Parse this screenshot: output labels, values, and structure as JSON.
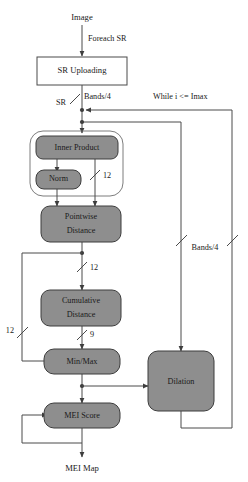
{
  "diagram": {
    "canvas": {
      "width": 248,
      "height": 482
    },
    "colors": {
      "background": "#ffffff",
      "process_fill": "#8e8e8e",
      "process_stroke": "#3d3d3d",
      "plain_fill": "#ffffff",
      "plain_stroke": "#4a4a4a",
      "group_stroke": "#6e6e6e",
      "edge": "#4a4a4a",
      "text": "#1a1a1a"
    },
    "terminals": {
      "input": "Image",
      "output": "MEI Map"
    },
    "nodes": [
      {
        "id": "sr_uploading",
        "label": "SR Uploading",
        "shape": "rect",
        "style": "plain"
      },
      {
        "id": "inner_product",
        "label": "Inner Product",
        "shape": "rounded",
        "style": "process"
      },
      {
        "id": "norm",
        "label": "Norm",
        "shape": "rounded",
        "style": "process"
      },
      {
        "id": "pointwise_distance",
        "label_line1": "Pointwise",
        "label_line2": "Distance",
        "shape": "rounded",
        "style": "process"
      },
      {
        "id": "cumulative_distance",
        "label_line1": "Cumulative",
        "label_line2": "Distance",
        "shape": "rounded",
        "style": "process"
      },
      {
        "id": "min_max",
        "label": "Min/Max",
        "shape": "rounded",
        "style": "process"
      },
      {
        "id": "mei_score",
        "label": "MEI Score",
        "shape": "rounded",
        "style": "process"
      },
      {
        "id": "dilation",
        "label": "Dilation",
        "shape": "rounded",
        "style": "process"
      }
    ],
    "group_box": {
      "id": "inner_product_group",
      "contains": [
        "inner_product",
        "norm"
      ]
    },
    "edge_labels": [
      {
        "id": "foreach_sr",
        "text": "Foreach SR"
      },
      {
        "id": "sr",
        "text": "SR"
      },
      {
        "id": "bands_4_top",
        "text": "Bands/4"
      },
      {
        "id": "while_i_imax",
        "text": "While i <= Imax"
      },
      {
        "id": "width_12_inner",
        "text": "12"
      },
      {
        "id": "width_12_pointwise",
        "text": "12"
      },
      {
        "id": "width_12_left",
        "text": "12"
      },
      {
        "id": "width_9",
        "text": "9"
      },
      {
        "id": "bands_4_right",
        "text": "Bands/4"
      }
    ]
  }
}
